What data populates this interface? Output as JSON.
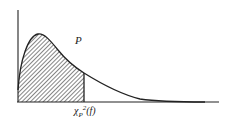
{
  "diagram": {
    "type": "chi-square distribution density curve",
    "region_label": "P",
    "critical_value_label": {
      "symbol": "χ",
      "subscript": "P",
      "superscript": "2",
      "argument": "(f)"
    },
    "shaded_region": "left of critical value (hatched)",
    "colors": {
      "line": "#222222",
      "hatch": "#333333",
      "background": "#ffffff"
    }
  }
}
